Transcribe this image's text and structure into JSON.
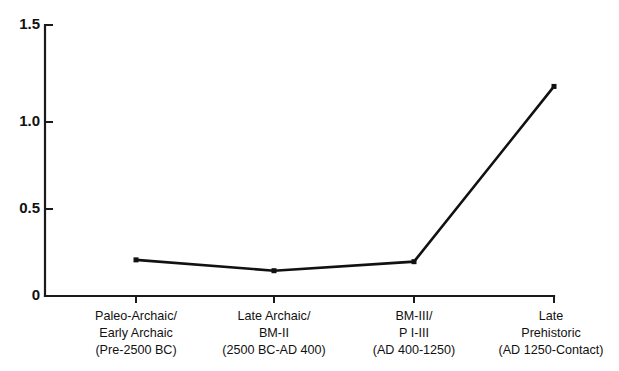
{
  "chart_data": {
    "type": "line",
    "title": "",
    "subtitle": "",
    "xlabel": "",
    "ylabel": "",
    "categories": [
      "Paleo-Archaic/\nEarly Archaic\n(Pre-2500 BC)",
      "Late Archaic/\nBM-II\n(2500 BC-AD 400)",
      "BM-III/\nP I-III\n(AD 400-1250)",
      "Late\nPrehistoric\n(AD 1250-Contact)"
    ],
    "category_lines": [
      [
        "Paleo-Archaic/",
        "Early Archaic",
        "(Pre-2500 BC)"
      ],
      [
        "Late Archaic/",
        "BM-II",
        "(2500 BC-AD 400)"
      ],
      [
        "BM-III/",
        "P I-III",
        "(AD 400-1250)"
      ],
      [
        "Late",
        "Prehistoric",
        "(AD 1250-Contact)"
      ]
    ],
    "values": [
      0.2,
      0.14,
      0.19,
      1.16
    ],
    "ylim": [
      0,
      1.5
    ],
    "yticks": [
      0,
      0.5,
      1.0,
      1.5
    ],
    "ytick_labels": [
      "0",
      "0.5",
      "1.0",
      "1.5"
    ],
    "grid": false,
    "legend": false,
    "legend_position": "none",
    "marker": "filled-square",
    "line_color": "#111111",
    "marker_color": "#111111",
    "axis_color": "#1a1a1a",
    "background_color": "#ffffff"
  },
  "axes": {
    "y_axis_name": "value-axis",
    "x_axis_name": "period-axis"
  }
}
